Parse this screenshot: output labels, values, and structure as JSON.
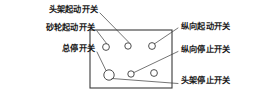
{
  "figure": {
    "type": "machine-control-panel-callout-diagram",
    "background_color": "#ffffff",
    "line_color": "#3a3a3a",
    "text_color": "#1a1a1a"
  },
  "panel": {
    "name": "control-panel",
    "x": 90,
    "y": 30,
    "width": 82,
    "height": 58
  },
  "switches": [
    {
      "id": "head-start",
      "label": "头架起动开关",
      "cx": 106,
      "cy": 47,
      "r": 3.4,
      "row": "top",
      "col": 1
    },
    {
      "id": "wheel-start",
      "label": "砂轮起动开关",
      "cx": 128,
      "cy": 46,
      "r": 3.2,
      "row": "top",
      "col": 2
    },
    {
      "id": "longitudinal-start",
      "label": "纵向起动开关",
      "cx": 152,
      "cy": 46,
      "r": 3.4,
      "row": "top",
      "col": 3
    },
    {
      "id": "master-stop",
      "label": "总停开关",
      "cx": 109,
      "cy": 75,
      "r": 5.2,
      "row": "bottom",
      "col": 1
    },
    {
      "id": "longitudinal-stop",
      "label": "纵向停止开关",
      "cx": 131,
      "cy": 74,
      "r": 3.2,
      "row": "bottom",
      "col": 2
    },
    {
      "id": "head-stop",
      "label": "头架停止开关",
      "cx": 154,
      "cy": 73,
      "r": 3.4,
      "row": "bottom",
      "col": 3
    }
  ],
  "labels": {
    "left": [
      {
        "id": "head-start-label",
        "text": "头架起动开关",
        "x": 98,
        "y": 9,
        "align": "right"
      },
      {
        "id": "wheel-start-label",
        "text": "砂轮起动开关",
        "x": 95,
        "y": 27,
        "align": "right"
      },
      {
        "id": "master-stop-label",
        "text": "总停开关",
        "x": 95,
        "y": 48,
        "align": "right"
      }
    ],
    "right": [
      {
        "id": "longitudinal-start-label",
        "text": "纵向起动开关",
        "x": 181,
        "y": 26,
        "align": "left"
      },
      {
        "id": "longitudinal-stop-label",
        "text": "纵向停止开关",
        "x": 181,
        "y": 49,
        "align": "left"
      },
      {
        "id": "head-stop-label",
        "text": "头架停止开关",
        "x": 181,
        "y": 80,
        "align": "left"
      }
    ]
  },
  "leaders": [
    {
      "id": "leader-head-start",
      "points": "100,13 128,42"
    },
    {
      "id": "leader-wheel-start",
      "points": "97,31 106,43"
    },
    {
      "id": "leader-master-stop",
      "points": "97,52 106,71"
    },
    {
      "id": "leader-longitudinal-start",
      "points": "155,44 178,28"
    },
    {
      "id": "leader-longitudinal-stop",
      "points": "134,72 178,52"
    },
    {
      "id": "leader-head-stop",
      "points": "113,78 178,83"
    }
  ]
}
